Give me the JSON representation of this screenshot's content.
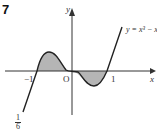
{
  "question_number": "7",
  "axes": {
    "x_label": "x",
    "y_label": "y"
  },
  "curve_label": "y = x³ − x",
  "tick_labels": {
    "neg_one": "−1",
    "origin": "O",
    "one": "1"
  },
  "corner_fraction": {
    "numerator": "1",
    "denominator": "6"
  },
  "colors": {
    "curve": "#222222",
    "shade": "#b5b5b5",
    "axis": "#333333"
  }
}
